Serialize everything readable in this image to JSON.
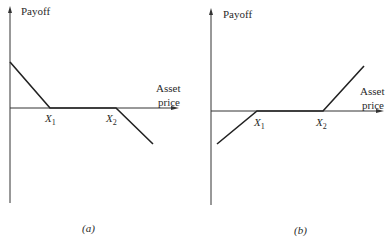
{
  "panels": [
    {
      "id": "a",
      "caption": "(a)",
      "y_axis_label": "Payoff",
      "x_axis_label_line1": "Asset",
      "x_axis_label_line2": "price",
      "x1_label": "X",
      "x1_sub": "1",
      "x2_label": "X",
      "x2_sub": "2",
      "description": "Payoff positive at zero price, declines to zero at X1, flat between X1 and X2, declines below zero after X2"
    },
    {
      "id": "b",
      "caption": "(b)",
      "y_axis_label": "Payoff",
      "x_axis_label_line1": "Asset",
      "x_axis_label_line2": "price",
      "x1_label": "X",
      "x1_sub": "1",
      "x2_label": "X",
      "x2_sub": "2",
      "description": "Payoff negative at zero price, rises to zero at X1, flat between X1 and X2, rises above zero after X2"
    }
  ],
  "colors": {
    "line": "#222222",
    "axis": "#333333",
    "background": "#ffffff"
  }
}
